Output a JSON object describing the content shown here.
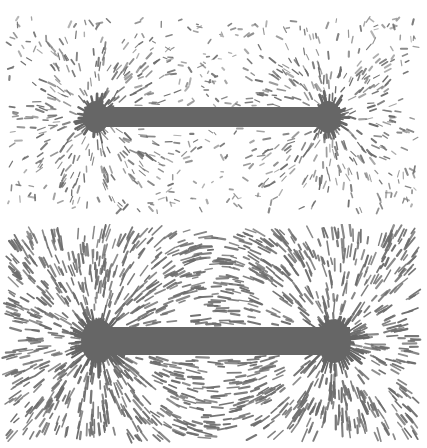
{
  "image": {
    "width": 427,
    "height": 448,
    "background": "#ffffff",
    "filing_color": "#6e6e6e",
    "bar_color": "#666666"
  },
  "panels": [
    {
      "id": "top",
      "description": "Bar magnet with loosely scattered iron filings",
      "offset_y": 0,
      "height": 224,
      "bar": {
        "x1": 86,
        "x2": 340,
        "y": 117,
        "thickness": 20
      },
      "poles": [
        {
          "x": 96,
          "y": 117
        },
        {
          "x": 328,
          "y": 117
        }
      ],
      "field_area": {
        "x1": 8,
        "x2": 416,
        "y1": 18,
        "y2": 212
      },
      "pattern": "scattered",
      "filing_count": 1100
    },
    {
      "id": "bottom",
      "description": "Bar magnet with iron filings aligned along dipole field lines",
      "offset_y": 224,
      "height": 224,
      "bar": {
        "x1": 86,
        "x2": 350,
        "y": 117,
        "thickness": 28
      },
      "poles": [
        {
          "x": 98,
          "y": 117
        },
        {
          "x": 334,
          "y": 117
        }
      ],
      "field_area": {
        "x1": 8,
        "x2": 416,
        "y1": 6,
        "y2": 214
      },
      "pattern": "aligned",
      "filing_count": 1500
    }
  ]
}
